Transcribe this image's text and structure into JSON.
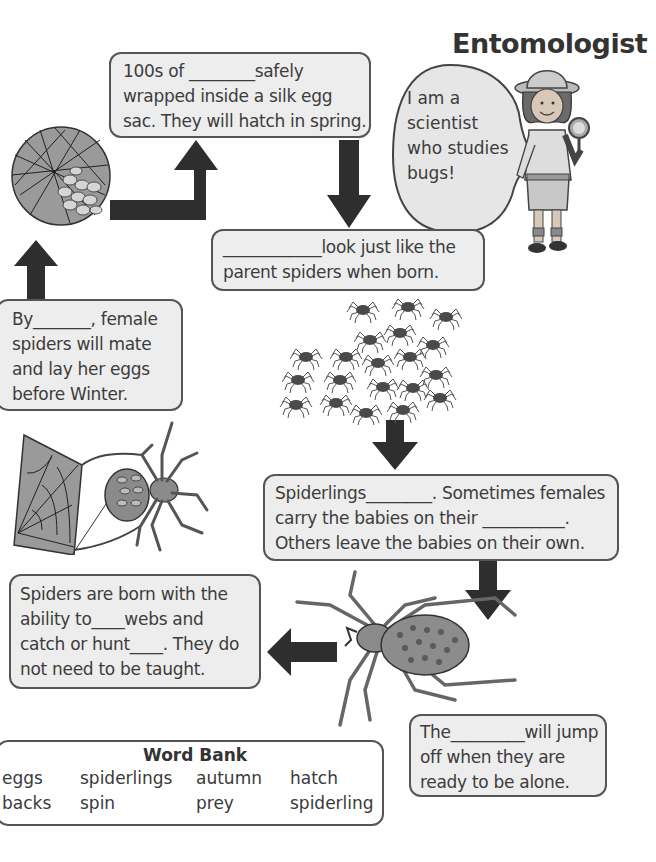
{
  "title": "Entomologist",
  "speech_bubble": {
    "lines": [
      "I am a",
      "scientist",
      "who studies",
      "bugs!"
    ]
  },
  "steps": {
    "egg_sac": {
      "lines": [
        "100s of ________safely",
        "wrapped inside a silk egg",
        "sac. They will hatch in spring."
      ]
    },
    "look_like": {
      "lines": [
        "____________look just like the",
        "parent spiders when born."
      ]
    },
    "spiderlings_hatch": {
      "lines": [
        "Spiderlings________. Sometimes females",
        "carry the babies on their __________.",
        "Others leave the babies on their own."
      ]
    },
    "jump_off": {
      "lines": [
        "The_________will jump",
        "off when they are",
        "ready to be alone."
      ]
    },
    "born_with": {
      "lines": [
        "Spiders are born with the",
        "ability to____webs and",
        "catch or hunt____. They do",
        "not need to be taught."
      ]
    },
    "autumn": {
      "lines": [
        "By_______, female",
        "spiders will mate",
        "and lay her eggs",
        "before Winter."
      ]
    }
  },
  "word_bank": {
    "title": "Word Bank",
    "rows": [
      [
        "eggs",
        "spiderlings",
        "autumn",
        "hatch"
      ],
      [
        "backs",
        "spin",
        "prey",
        "spiderling"
      ]
    ]
  },
  "colors": {
    "box_fill": "#ededed",
    "box_border": "#555555",
    "arrow": "#2e2e2e"
  }
}
